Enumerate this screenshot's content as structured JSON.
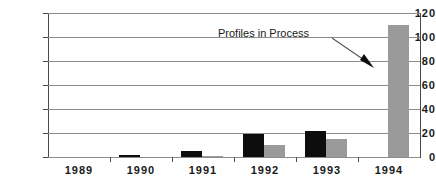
{
  "chart_data": {
    "type": "bar",
    "title": "",
    "subtitle": "",
    "xlabel": "",
    "ylabel": "",
    "categories": [
      "1989",
      "1990",
      "1991",
      "1992",
      "1993",
      "1994"
    ],
    "series": [
      {
        "name": "series-1",
        "color": "#0d0d0d",
        "values": [
          0,
          2,
          5,
          19,
          22,
          0
        ]
      },
      {
        "name": "series-2",
        "color": "#9a9a9a",
        "values": [
          0,
          0,
          1,
          10,
          15,
          110
        ]
      }
    ],
    "ylim": [
      0,
      120
    ],
    "ytick_values": [
      0,
      20,
      40,
      60,
      80,
      100,
      120
    ],
    "ytick_labels": [
      "0",
      "20",
      "40",
      "60",
      "80",
      "100",
      "120"
    ],
    "grid": true,
    "grid_axis": "y",
    "legend": false,
    "legend_position": "none",
    "background_color": "#ffffff",
    "annotations": [
      {
        "text": "Profiles in Process",
        "points_to": "1994 gray bar",
        "arrow": true
      }
    ]
  }
}
